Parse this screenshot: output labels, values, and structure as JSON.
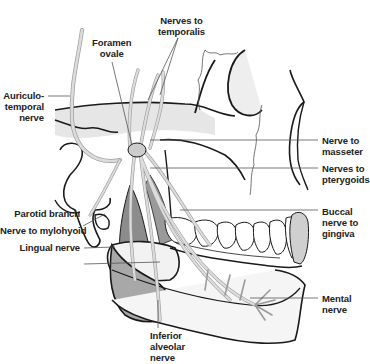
{
  "diagram": {
    "colors": {
      "background": "#ffffff",
      "outline": "#1a1a1a",
      "nerve": "#d4d4d4",
      "nerve_edge": "#9a9a9a",
      "muscle": "#8c8c8c",
      "tongue": "#a8a8a8",
      "bone_shade": "#e6e6e6",
      "leader_line": "#555555"
    },
    "labels": {
      "nerves_to_temporalis": [
        "Nerves to",
        "temporalis"
      ],
      "foramen_ovale": [
        "Foramen",
        "ovale"
      ],
      "auriculotemporal_nerve": [
        "Auriculo-",
        "temporal",
        "nerve"
      ],
      "nerve_to_masseter": [
        "Nerve to",
        "masseter"
      ],
      "nerves_to_pterygoids": [
        "Nerves to",
        "pterygoids"
      ],
      "parotid_branch": "Parotid branch",
      "nerve_to_mylohyoid": "Nerve to mylohyoid",
      "lingual_nerve": "Lingual nerve",
      "buccal_nerve_to_gingiva": [
        "Buccal",
        "nerve to",
        "gingiva"
      ],
      "mental_nerve": [
        "Mental",
        "nerve"
      ],
      "inferior_alveolar_nerve": [
        "Inferior",
        "alveolar",
        "nerve"
      ]
    }
  }
}
